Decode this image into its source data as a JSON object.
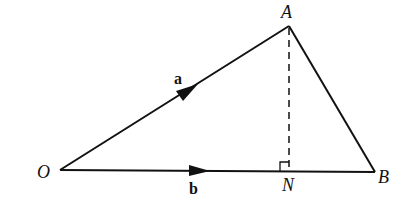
{
  "figure": {
    "type": "vector-projection-diagram",
    "points": {
      "O": {
        "label": "O",
        "x": 60,
        "y": 170
      },
      "A": {
        "label": "A",
        "x": 289,
        "y": 26
      },
      "N": {
        "label": "N",
        "x": 289,
        "y": 171
      },
      "B": {
        "label": "B",
        "x": 375,
        "y": 172
      }
    },
    "vectors": {
      "a": {
        "label": "a",
        "from": "O",
        "to": "A"
      },
      "b": {
        "label": "b",
        "from": "O",
        "to": "B"
      }
    },
    "segments": [
      {
        "name": "AB",
        "style": "solid"
      },
      {
        "name": "AN",
        "style": "dashed"
      }
    ],
    "right_angle_at": "N",
    "colors": {
      "stroke": "#111111",
      "background": "#ffffff"
    }
  }
}
